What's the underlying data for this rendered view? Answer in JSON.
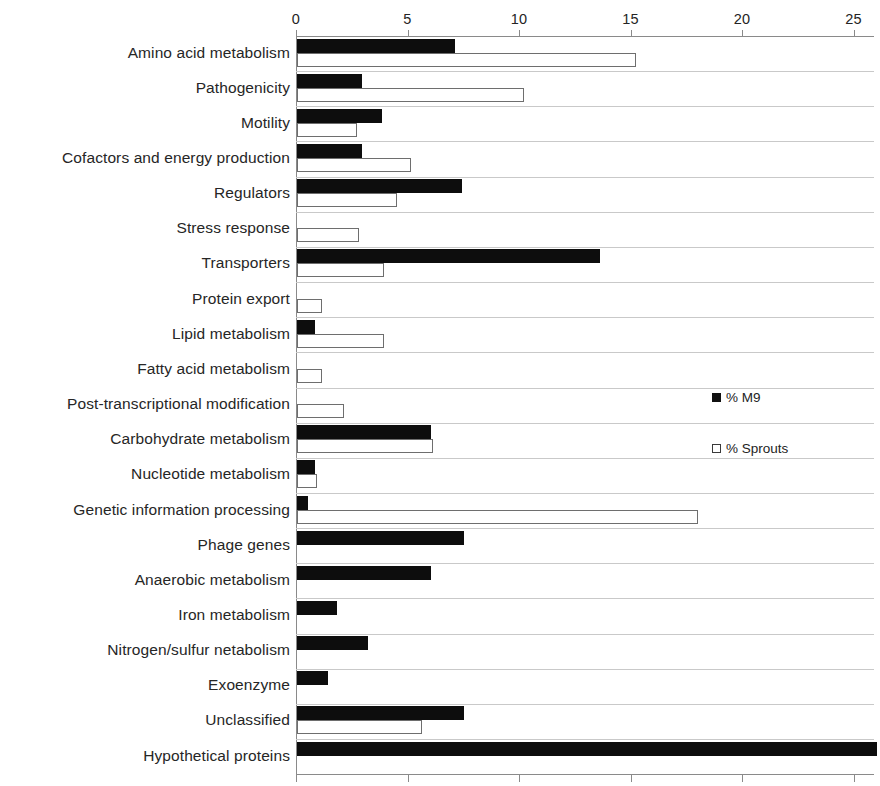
{
  "chart_data": {
    "type": "bar",
    "orientation": "horizontal",
    "title": "",
    "subtitle": "",
    "xlabel": "",
    "ylabel": "",
    "xlim": [
      0,
      26.5
    ],
    "xticks": [
      0,
      5,
      10,
      15,
      20,
      25
    ],
    "xtick_labels": [
      "0",
      "5",
      "10",
      "15",
      "20",
      "25"
    ],
    "grid": false,
    "legend_position": "right-middle",
    "categories": [
      "Amino acid metabolism",
      "Pathogenicity",
      "Motility",
      "Cofactors and energy production",
      "Regulators",
      "Stress response",
      "Transporters",
      "Protein export",
      "Lipid metabolism",
      "Fatty acid metabolism",
      "Post-transcriptional modification",
      "Carbohydrate metabolism",
      "Nucleotide metabolism",
      "Genetic information processing",
      "Phage genes",
      "Anaerobic metabolism",
      "Iron metabolism",
      "Nitrogen/sulfur netabolism",
      "Exoenzyme",
      "Unclassified",
      "Hypothetical proteins"
    ],
    "series": [
      {
        "name": "% M9",
        "color": "#0d0d0d",
        "style": "filled",
        "values": [
          7.1,
          2.9,
          3.8,
          2.9,
          7.4,
          0,
          13.6,
          0,
          0.8,
          0,
          0,
          6.0,
          0.8,
          0.5,
          7.5,
          6.0,
          1.8,
          3.2,
          1.4,
          7.5,
          26.0
        ]
      },
      {
        "name": "% Sprouts",
        "color": "#ffffff",
        "style": "open",
        "values": [
          15.2,
          10.2,
          2.7,
          5.1,
          4.5,
          2.8,
          3.9,
          1.1,
          3.9,
          1.1,
          2.1,
          6.1,
          0.9,
          18.0,
          0,
          0,
          0,
          0,
          0,
          5.6,
          0
        ]
      }
    ]
  },
  "legend": {
    "items": [
      {
        "label": "% M9",
        "marker": "filled-square"
      },
      {
        "label": "% Sprouts",
        "marker": "open-square"
      }
    ]
  }
}
